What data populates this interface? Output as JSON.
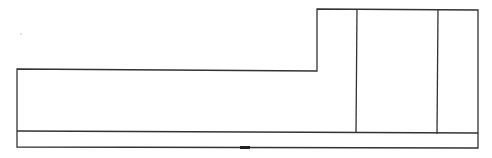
{
  "diagram": {
    "type": "line-drawing outline",
    "stroke_color": "#333333",
    "background": "#ffffff",
    "outline_points": [
      [
        17,
        69
      ],
      [
        317,
        71
      ],
      [
        317,
        9
      ],
      [
        478,
        10
      ],
      [
        478,
        148
      ],
      [
        17,
        147
      ]
    ],
    "band_line": {
      "x1": 17,
      "y1": 131,
      "x2": 478,
      "y2": 133
    },
    "dividers": [
      {
        "x1": 357,
        "y1": 9,
        "x2": 356,
        "y2": 133
      },
      {
        "x1": 438,
        "y1": 10,
        "x2": 437,
        "y2": 134
      }
    ],
    "bottom_marker": {
      "x": 240,
      "y": 146,
      "width": 10,
      "height": 3,
      "color": "#222222"
    },
    "speck": {
      "x": 21,
      "y": 34,
      "color": "#bbbbbb"
    }
  }
}
